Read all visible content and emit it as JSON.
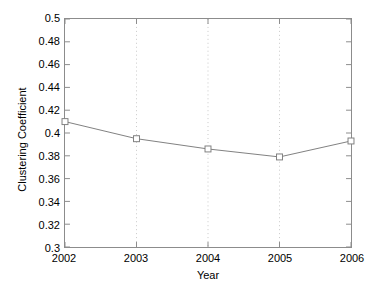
{
  "chart_data": {
    "type": "line",
    "title": "",
    "xlabel": "Year",
    "ylabel": "Clustering Coefficient",
    "categories": [
      "2002",
      "2003",
      "2004",
      "2005",
      "2006"
    ],
    "x": [
      2002,
      2003,
      2004,
      2005,
      2006
    ],
    "values": [
      0.41,
      0.395,
      0.386,
      0.379,
      0.393
    ],
    "series": [
      {
        "name": "Clustering Coefficient",
        "values": [
          0.41,
          0.395,
          0.386,
          0.379,
          0.393
        ],
        "line_color": "#808080",
        "marker": "square",
        "marker_color": "#808080",
        "marker_face_color": "#ffffff"
      }
    ],
    "xlim": [
      2002,
      2006
    ],
    "ylim": [
      0.3,
      0.5
    ],
    "ytick_step": 0.02,
    "yticks": [
      0.5,
      0.48,
      0.46,
      0.44,
      0.42,
      0.4,
      0.38,
      0.36,
      0.34,
      0.32,
      0.3
    ],
    "ytick_labels": [
      "0.5",
      "0.48",
      "0.46",
      "0.44",
      "0.42",
      "0.4",
      "0.38",
      "0.36",
      "0.34",
      "0.32",
      "0.3"
    ],
    "xticks": [
      2002,
      2003,
      2004,
      2005,
      2006
    ],
    "xtick_labels": [
      "2002",
      "2003",
      "2004",
      "2005",
      "2006"
    ],
    "grid": {
      "x": true,
      "y": false,
      "style": "dotted",
      "color": "#c8c8c8"
    },
    "legend": null,
    "axis_color": "#8c8c8c",
    "background_color": "#ffffff"
  }
}
